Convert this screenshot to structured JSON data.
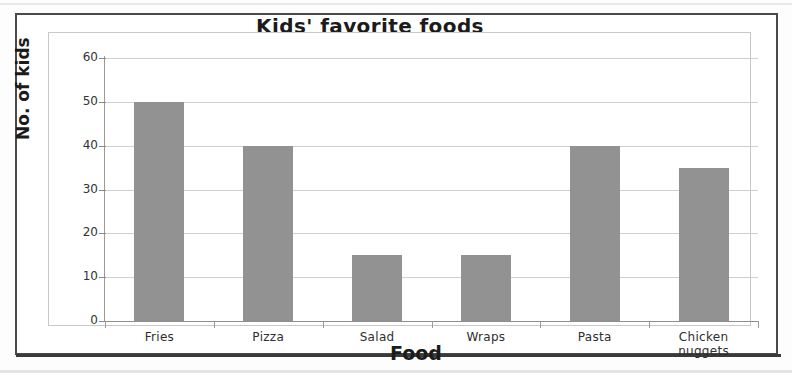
{
  "chart_data": {
    "type": "bar",
    "title": "Kids' favorite foods",
    "xlabel": "Food",
    "ylabel": "No. of kids",
    "categories": [
      "Fries",
      "Pizza",
      "Salad",
      "Wraps",
      "Pasta",
      "Chicken nuggets"
    ],
    "values": [
      50,
      40,
      15,
      15,
      40,
      35
    ],
    "ylim": [
      0,
      60
    ],
    "yticks": [
      0,
      10,
      20,
      30,
      40,
      50,
      60
    ],
    "ytick_labels": [
      "0",
      "10",
      "20",
      "30",
      "40",
      "50",
      "60"
    ],
    "grid": true,
    "legend": "none",
    "bar_color": "#929292",
    "gridline_color": "#cfcfcf",
    "axis_color": "#9a9a9a",
    "text_color": "#1b1b1b",
    "background": "#ffffff"
  },
  "categories_display": [
    {
      "line1": "Fries",
      "line2": ""
    },
    {
      "line1": "Pizza",
      "line2": ""
    },
    {
      "line1": "Salad",
      "line2": ""
    },
    {
      "line1": "Wraps",
      "line2": ""
    },
    {
      "line1": "Pasta",
      "line2": ""
    },
    {
      "line1": "Chicken",
      "line2": "nuggets"
    }
  ]
}
